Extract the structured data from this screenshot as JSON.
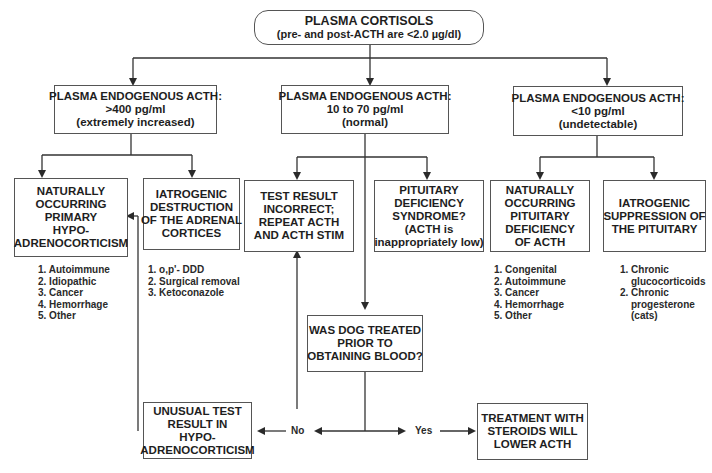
{
  "diagram": {
    "root": {
      "title": "PLASMA CORTISOLS",
      "subtitle": "(pre- and post-ACTH are <2.0 µg/dl)"
    },
    "branches": [
      {
        "heading": "PLASMA ENDOGENOUS ACTH:",
        "value": ">400 pg/ml",
        "qualifier": "(extremely increased)"
      },
      {
        "heading": "PLASMA ENDOGENOUS ACTH:",
        "value": "10 to 70 pg/ml",
        "qualifier": "(normal)"
      },
      {
        "heading": "PLASMA ENDOGENOUS ACTH:",
        "value": "<10 pg/ml",
        "qualifier": "(undetectable)"
      }
    ],
    "outcomes": {
      "primary_hypoadrenocorticism": {
        "lines": [
          "NATURALLY",
          "OCCURRING",
          "PRIMARY",
          "HYPO-",
          "ADRENOCORTICISM"
        ],
        "causes": [
          "1. Autoimmune",
          "2. Idiopathic",
          "3. Cancer",
          "4. Hemorrhage",
          "5. Other"
        ]
      },
      "iatrogenic_adrenal": {
        "lines": [
          "IATROGENIC",
          "DESTRUCTION",
          "OF THE ADRENAL",
          "CORTICES"
        ],
        "causes": [
          "1. o,p'- DDD",
          "2. Surgical removal",
          "3. Ketoconazole"
        ]
      },
      "test_incorrect": {
        "lines": [
          "TEST RESULT",
          "INCORRECT;",
          "REPEAT ACTH",
          "AND ACTH STIM"
        ]
      },
      "pituitary_deficiency_syndrome": {
        "lines": [
          "PITUITARY",
          "DEFICIENCY",
          "SYNDROME?",
          "(ACTH is",
          "inappropriately low)"
        ]
      },
      "natural_pituitary_deficiency": {
        "lines": [
          "NATURALLY",
          "OCCURRING",
          "PITUITARY",
          "DEFICIENCY",
          "OF ACTH"
        ],
        "causes": [
          "1. Congenital",
          "2. Autoimmune",
          "3. Cancer",
          "4. Hemorrhage",
          "5. Other"
        ]
      },
      "iatrogenic_pituitary": {
        "lines": [
          "IATROGENIC",
          "SUPPRESSION OF",
          "THE PITUITARY"
        ],
        "causes": [
          {
            "num": "1. Chronic",
            "cont": [
              "glucocorticoids"
            ]
          },
          {
            "num": "2. Chronic",
            "cont": [
              "progesterone",
              "(cats)"
            ]
          }
        ]
      }
    },
    "question": {
      "lines": [
        "WAS DOG TREATED",
        "PRIOR TO",
        "OBTAINING BLOOD?"
      ],
      "no_label": "No",
      "yes_label": "Yes"
    },
    "no_result": {
      "lines": [
        "UNUSUAL TEST",
        "RESULT IN",
        "HYPO-",
        "ADRENOCORTICISM"
      ]
    },
    "yes_result": {
      "lines": [
        "TREATMENT WITH",
        "STEROIDS WILL",
        "LOWER ACTH"
      ]
    },
    "colors": {
      "line": "#333333",
      "box_border": "#555555",
      "text": "#1e1e1e"
    }
  }
}
